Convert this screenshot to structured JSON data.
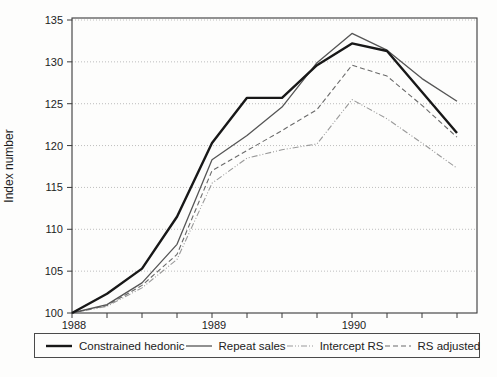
{
  "chart": {
    "y_axis_label": "Index number",
    "y_ticks": [
      100,
      105,
      110,
      115,
      120,
      125,
      130,
      135
    ],
    "year_labels": [
      {
        "label": "1988",
        "point_index": 0
      },
      {
        "label": "1989",
        "point_index": 4
      },
      {
        "label": "1990",
        "point_index": 8
      }
    ]
  },
  "chart_data": {
    "type": "line",
    "title": "",
    "xlabel": "",
    "ylabel": "Index number",
    "ylim": [
      100,
      135
    ],
    "grid": true,
    "legend_position": "bottom",
    "x": [
      "1988 Q1",
      "1988 Q2",
      "1988 Q3",
      "1988 Q4",
      "1989 Q1",
      "1989 Q2",
      "1989 Q3",
      "1989 Q4",
      "1990 Q1",
      "1990 Q2",
      "1990 Q3",
      "1990 Q4"
    ],
    "series": [
      {
        "name": "Constrained hedonic",
        "style": "thick-solid",
        "color": "#181818",
        "values": [
          100,
          102.3,
          105.3,
          111.5,
          120.3,
          125.7,
          125.7,
          129.6,
          132.2,
          131.3,
          126.4,
          121.5
        ]
      },
      {
        "name": "Repeat sales",
        "style": "thin-solid",
        "color": "#555555",
        "values": [
          100,
          101.0,
          103.6,
          108.2,
          118.3,
          121.2,
          124.6,
          129.9,
          133.4,
          131.4,
          128.0,
          125.3
        ]
      },
      {
        "name": "Intercept RS",
        "style": "dash-dot",
        "color": "#9a9a9a",
        "values": [
          100,
          100.8,
          103.0,
          106.4,
          115.5,
          118.5,
          119.5,
          120.2,
          125.5,
          123.2,
          120.3,
          117.3
        ]
      },
      {
        "name": "RS adjusted",
        "style": "dashed",
        "color": "#6a6a6a",
        "values": [
          100,
          100.9,
          103.3,
          107.0,
          117.0,
          119.4,
          121.8,
          124.3,
          129.6,
          128.3,
          124.8,
          121.0
        ]
      }
    ]
  },
  "colors": {
    "grid": "#adadad",
    "axis": "#3a3a3a",
    "text": "#1c1c1c",
    "background": "#fdfdfc"
  }
}
